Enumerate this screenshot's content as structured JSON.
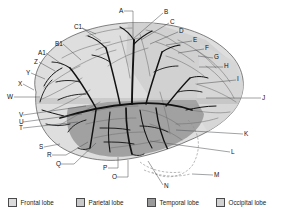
{
  "figure": {
    "view_type": "brain-lateral-diagram"
  },
  "legend": {
    "items": [
      {
        "label": "Frontal lobe",
        "color": "#dcdcdc",
        "x": 8,
        "swatch_name": "frontal-lobe-swatch"
      },
      {
        "label": "Parietal lobe",
        "color": "#c9c9c9",
        "x": 76,
        "swatch_name": "parietal-lobe-swatch"
      },
      {
        "label": "Temporal lobe",
        "color": "#9a9a9a",
        "x": 147,
        "swatch_name": "temporal-lobe-swatch"
      },
      {
        "label": "Occipital lobe",
        "color": "#d2d2d2",
        "x": 216,
        "swatch_name": "occipital-lobe-swatch"
      }
    ]
  },
  "labels": [
    {
      "id": "A",
      "text": "A",
      "tx": 119,
      "ty": 11,
      "path": "M 124 11 L 133 11 L 133 38"
    },
    {
      "id": "B",
      "text": "B",
      "tx": 164,
      "ty": 12,
      "path": "M 163 13 L 133 39"
    },
    {
      "id": "C",
      "text": "C",
      "tx": 170,
      "ty": 22,
      "path": "M 169 23 L 141 40"
    },
    {
      "id": "D",
      "text": "D",
      "tx": 179,
      "ty": 31,
      "path": "M 178 32 L 150 44"
    },
    {
      "id": "E",
      "text": "E",
      "tx": 193,
      "ty": 40,
      "path": "M 192 41 L 166 45"
    },
    {
      "id": "F",
      "text": "F",
      "tx": 205,
      "ty": 48,
      "path": "M 204 49 L 178 53"
    },
    {
      "id": "G",
      "text": "G",
      "tx": 214,
      "ty": 57,
      "path": "M 213 58 L 198 56"
    },
    {
      "id": "H",
      "text": "H",
      "tx": 224,
      "ty": 66,
      "path": "M 223 67 L 199 67"
    },
    {
      "id": "I",
      "text": "I",
      "tx": 237,
      "ty": 79,
      "path": "M 236 80 L 197 84"
    },
    {
      "id": "J",
      "text": "J",
      "tx": 262,
      "ty": 98,
      "path": "M 261 98 L 206 98"
    },
    {
      "id": "K",
      "text": "K",
      "tx": 244,
      "ty": 134,
      "path": "M 243 134 L 176 130"
    },
    {
      "id": "L",
      "text": "L",
      "tx": 231,
      "ty": 152,
      "path": "M 230 152 L 150 141"
    },
    {
      "id": "M",
      "text": "M",
      "tx": 214,
      "ty": 175,
      "path": "M 213 175 L 192 174"
    },
    {
      "id": "N",
      "text": "N",
      "tx": 164,
      "ty": 186,
      "path": "M 163 185 L 148 161"
    },
    {
      "id": "O",
      "text": "O",
      "tx": 112,
      "ty": 177,
      "path": "M 117 177 L 128 177 L 128 160"
    },
    {
      "id": "P",
      "text": "P",
      "tx": 103,
      "ty": 168,
      "path": "M 108 168 L 118 168 L 118 157"
    },
    {
      "id": "Q",
      "text": "Q",
      "tx": 56,
      "ty": 164,
      "path": "M 61 164 L 74 164 L 96 143"
    },
    {
      "id": "R",
      "text": "R",
      "tx": 47,
      "ty": 155,
      "path": "M 52 155 L 66 155 L 88 142"
    },
    {
      "id": "S",
      "text": "S",
      "tx": 39,
      "ty": 147,
      "path": "M 44 147 L 60 144"
    },
    {
      "id": "T",
      "text": "T",
      "tx": 19,
      "ty": 128,
      "path": "M 23 128 L 78 122"
    },
    {
      "id": "U",
      "text": "U",
      "tx": 19,
      "ty": 122,
      "path": "M 23 122 L 82 114"
    },
    {
      "id": "V",
      "text": "V",
      "tx": 19,
      "ty": 115,
      "path": "M 23 115 L 86 106"
    },
    {
      "id": "W",
      "text": "W",
      "tx": 7,
      "ty": 97,
      "path": "M 14 97 L 40 97"
    },
    {
      "id": "X",
      "text": "X",
      "tx": 18,
      "ty": 84,
      "path": "M 23 84 L 34 90"
    },
    {
      "id": "Y",
      "text": "Y",
      "tx": 26,
      "ty": 73,
      "path": "M 31 73 L 45 79"
    },
    {
      "id": "Z",
      "text": "Z",
      "tx": 34,
      "ty": 62,
      "path": "M 39 62 L 55 71"
    },
    {
      "id": "A1",
      "text": "A1",
      "tx": 38,
      "ty": 53,
      "path": "M 46 53 L 63 65"
    },
    {
      "id": "B1",
      "text": "B1",
      "tx": 55,
      "ty": 44,
      "path": "M 63 44 L 81 60"
    },
    {
      "id": "C1",
      "text": "C1",
      "tx": 74,
      "ty": 27,
      "path": "M 82 28 L 101 41 M 82 28 L 96 34"
    }
  ],
  "anatomy": {
    "lobe_regions": [
      {
        "name": "frontal-lobe-region",
        "color": "#dedede"
      },
      {
        "name": "parietal-lobe-region",
        "color": "#cccccc"
      },
      {
        "name": "temporal-lobe-region",
        "color": "#9d9d9d"
      },
      {
        "name": "occipital-lobe-region",
        "color": "#d4d4d4"
      }
    ],
    "vessel_color": "#141414",
    "sulci_color": "#6d6d6d",
    "outline_color": "#4d4d4d"
  }
}
